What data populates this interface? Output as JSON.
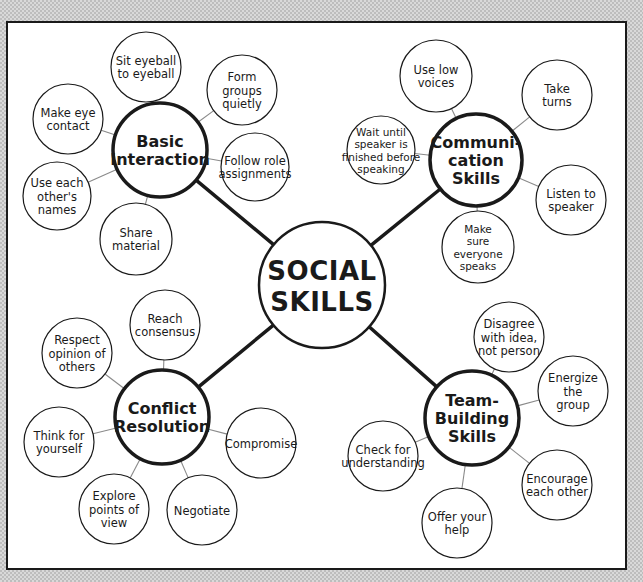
{
  "diagram": {
    "type": "concept-map",
    "root": {
      "label_lines": [
        "SOCIAL",
        "SKILLS"
      ]
    },
    "clusters": [
      {
        "id": "basic-interaction",
        "label_lines": [
          "Basic",
          "Interaction"
        ],
        "items": [
          {
            "label_lines": [
              "Sit eyeball",
              "to eyeball"
            ]
          },
          {
            "label_lines": [
              "Form",
              "groups",
              "quietly"
            ]
          },
          {
            "label_lines": [
              "Follow role",
              "assignments"
            ]
          },
          {
            "label_lines": [
              "Share",
              "material"
            ]
          },
          {
            "label_lines": [
              "Use each",
              "other's",
              "names"
            ]
          },
          {
            "label_lines": [
              "Make eye",
              "contact"
            ]
          }
        ]
      },
      {
        "id": "communication-skills",
        "label_lines": [
          "Communi-",
          "cation",
          "Skills"
        ],
        "items": [
          {
            "label_lines": [
              "Use low",
              "voices"
            ]
          },
          {
            "label_lines": [
              "Take",
              "turns"
            ]
          },
          {
            "label_lines": [
              "Listen to",
              "speaker"
            ]
          },
          {
            "label_lines": [
              "Make",
              "sure",
              "everyone",
              "speaks"
            ]
          },
          {
            "label_lines": [
              "Wait until",
              "speaker is",
              "finished before",
              "speaking"
            ]
          }
        ]
      },
      {
        "id": "conflict-resolution",
        "label_lines": [
          "Conflict",
          "Resolution"
        ],
        "items": [
          {
            "label_lines": [
              "Reach",
              "consensus"
            ]
          },
          {
            "label_lines": [
              "Compromise"
            ]
          },
          {
            "label_lines": [
              "Negotiate"
            ]
          },
          {
            "label_lines": [
              "Explore",
              "points of",
              "view"
            ]
          },
          {
            "label_lines": [
              "Think for",
              "yourself"
            ]
          },
          {
            "label_lines": [
              "Respect",
              "opinion of",
              "others"
            ]
          }
        ]
      },
      {
        "id": "team-building-skills",
        "label_lines": [
          "Team-",
          "Building",
          "Skills"
        ],
        "items": [
          {
            "label_lines": [
              "Disagree",
              "with idea,",
              "not person"
            ]
          },
          {
            "label_lines": [
              "Energize",
              "the",
              "group"
            ]
          },
          {
            "label_lines": [
              "Encourage",
              "each other"
            ]
          },
          {
            "label_lines": [
              "Offer your",
              "help"
            ]
          },
          {
            "label_lines": [
              "Check for",
              "understanding"
            ]
          }
        ]
      }
    ]
  },
  "colors": {
    "ink": "#1a1a1a",
    "connector": "#8a8a8a",
    "paper": "#ffffff"
  }
}
